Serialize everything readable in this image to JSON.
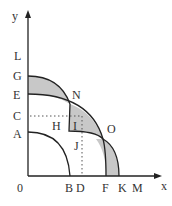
{
  "diagram": {
    "type": "production-possibility-frontiers",
    "axes": {
      "y_label": "y",
      "x_label": "x",
      "origin_label": "0"
    },
    "y_axis_labels": [
      "L",
      "G",
      "E",
      "C",
      "A"
    ],
    "x_axis_labels": [
      "B",
      "D",
      "F",
      "K",
      "M"
    ],
    "point_labels": [
      "N",
      "O",
      "H",
      "I",
      "J"
    ],
    "colors": {
      "line": "#222222",
      "shade": "#c8c8c8",
      "dotted": "#555555",
      "text": "#333333"
    }
  }
}
